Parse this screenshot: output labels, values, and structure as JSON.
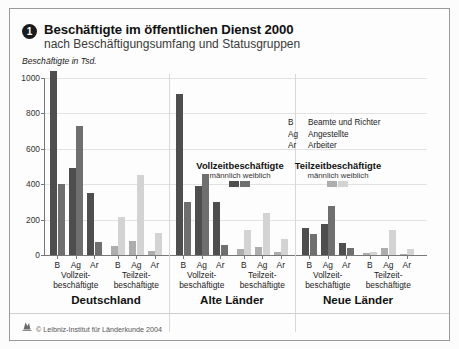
{
  "header": {
    "badge_number": "1",
    "title": "Beschäftigte im öffentlichen Dienst 2000",
    "subtitle": "nach Beschäftigungsumfang und Statusgruppen",
    "axis_unit_label": "Beschäftigte in Tsd."
  },
  "legend": {
    "status_keys": [
      {
        "abbr": "B",
        "desc": "Beamte und Richter"
      },
      {
        "abbr": "Ag",
        "desc": "Angestellte"
      },
      {
        "abbr": "Ar",
        "desc": "Arbeiter"
      }
    ],
    "blocks": [
      {
        "title": "Vollzeitbeschäftigte",
        "male_label": "männlich",
        "female_label": "weiblich",
        "male_color": "#4e4e4e",
        "female_color": "#6f6f6f"
      },
      {
        "title": "Teilzeitbeschäftigte",
        "male_label": "männlich",
        "female_label": "weiblich",
        "male_color": "#adadad",
        "female_color": "#d3d3d3"
      }
    ]
  },
  "footer": {
    "credit": "© Leibniz-Institut für Länderkunde 2004",
    "logo_icon": "institute-logo-icon"
  },
  "chart_data": {
    "type": "bar",
    "title": "Beschäftigte im öffentlichen Dienst 2000",
    "subtitle": "nach Beschäftigungsumfang und Statusgruppen",
    "xlabel": "",
    "ylabel": "Beschäftigte in Tsd.",
    "ylim": [
      0,
      1000
    ],
    "yticks": [
      0,
      200,
      400,
      600,
      800,
      1000
    ],
    "grid": true,
    "legend_position": "inside-right",
    "categories": [
      "B",
      "Ag",
      "Ar"
    ],
    "category_names": {
      "B": "Beamte und Richter",
      "Ag": "Angestellte",
      "Ar": "Arbeiter"
    },
    "series": [
      {
        "name": "Vollzeitbeschäftigte männlich",
        "color": "#4e4e4e"
      },
      {
        "name": "Vollzeitbeschäftigte weiblich",
        "color": "#6f6f6f"
      },
      {
        "name": "Teilzeitbeschäftigte männlich",
        "color": "#adadad"
      },
      {
        "name": "Teilzeitbeschäftigte weiblich",
        "color": "#d3d3d3"
      }
    ],
    "groups": [
      {
        "region": "Deutschland",
        "blocks": [
          {
            "employment": "Vollzeit-",
            "employment2": "beschäftigte",
            "bars": [
              {
                "cat": "B",
                "male": 1040,
                "female": 400
              },
              {
                "cat": "Ag",
                "male": 490,
                "female": 730
              },
              {
                "cat": "Ar",
                "male": 350,
                "female": 75
              }
            ]
          },
          {
            "employment": "Teilzeit-",
            "employment2": "beschäftigte",
            "bars": [
              {
                "cat": "B",
                "male": 50,
                "female": 215
              },
              {
                "cat": "Ag",
                "male": 80,
                "female": 450
              },
              {
                "cat": "Ar",
                "male": 20,
                "female": 125
              }
            ]
          }
        ]
      },
      {
        "region": "Alte Länder",
        "blocks": [
          {
            "employment": "Vollzeit-",
            "employment2": "beschäftigte",
            "bars": [
              {
                "cat": "B",
                "male": 910,
                "female": 300
              },
              {
                "cat": "Ag",
                "male": 390,
                "female": 455
              },
              {
                "cat": "Ar",
                "male": 300,
                "female": 55
              }
            ]
          },
          {
            "employment": "Teilzeit-",
            "employment2": "beschäftigte",
            "bars": [
              {
                "cat": "B",
                "male": 35,
                "female": 140
              },
              {
                "cat": "Ag",
                "male": 45,
                "female": 235
              },
              {
                "cat": "Ar",
                "male": 15,
                "female": 90
              }
            ]
          }
        ]
      },
      {
        "region": "Neue Länder",
        "blocks": [
          {
            "employment": "Vollzeit-",
            "employment2": "beschäftigte",
            "bars": [
              {
                "cat": "B",
                "male": 155,
                "female": 120
              },
              {
                "cat": "Ag",
                "male": 175,
                "female": 275
              },
              {
                "cat": "Ar",
                "male": 70,
                "female": 40
              }
            ]
          },
          {
            "employment": "Teilzeit-",
            "employment2": "beschäftigte",
            "bars": [
              {
                "cat": "B",
                "male": 12,
                "female": 15
              },
              {
                "cat": "Ag",
                "male": 38,
                "female": 140
              },
              {
                "cat": "Ar",
                "male": 8,
                "female": 35
              }
            ]
          }
        ]
      }
    ]
  }
}
